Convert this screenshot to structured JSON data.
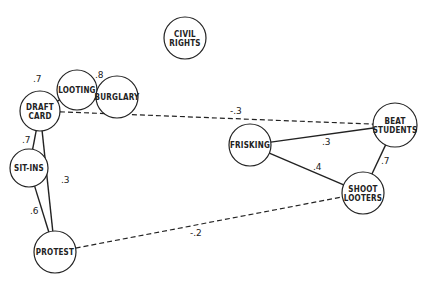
{
  "diagram": {
    "type": "correlation-network",
    "nodes": [
      {
        "id": "civil_rights",
        "lines": [
          "CIVIL",
          "RIGHTS"
        ],
        "x": 185,
        "y": 38,
        "r": 21
      },
      {
        "id": "looting",
        "lines": [
          "LOOTING"
        ],
        "x": 77,
        "y": 90,
        "r": 20
      },
      {
        "id": "burglary",
        "lines": [
          "BURGLARY"
        ],
        "x": 117,
        "y": 97,
        "r": 21
      },
      {
        "id": "draft_card",
        "lines": [
          "DRAFT",
          "CARD"
        ],
        "x": 40,
        "y": 111,
        "r": 20
      },
      {
        "id": "sit_ins",
        "lines": [
          "SIT-INS"
        ],
        "x": 29,
        "y": 168,
        "r": 19
      },
      {
        "id": "protest",
        "lines": [
          "PROTEST"
        ],
        "x": 55,
        "y": 252,
        "r": 21
      },
      {
        "id": "frisking",
        "lines": [
          "FRISKING"
        ],
        "x": 250,
        "y": 145,
        "r": 21
      },
      {
        "id": "beat_students",
        "lines": [
          "BEAT",
          "STUDENTS"
        ],
        "x": 395,
        "y": 125,
        "r": 22
      },
      {
        "id": "shoot_looters",
        "lines": [
          "SHOOT",
          "LOOTERS"
        ],
        "x": 363,
        "y": 193,
        "r": 21
      }
    ],
    "edges": [
      {
        "from": "draft_card",
        "to": "looting",
        "weight": ".7",
        "style": "solid",
        "lx": 33,
        "ly": 82
      },
      {
        "from": "looting",
        "to": "burglary",
        "weight": ".8",
        "style": "solid",
        "lx": 95,
        "ly": 78
      },
      {
        "from": "draft_card",
        "to": "sit_ins",
        "weight": ".7",
        "style": "solid",
        "lx": 22,
        "ly": 143
      },
      {
        "from": "draft_card",
        "to": "protest",
        "weight": ".3",
        "style": "solid",
        "lx": 61,
        "ly": 183
      },
      {
        "from": "sit_ins",
        "to": "protest",
        "weight": ".6",
        "style": "solid",
        "lx": 30,
        "ly": 214
      },
      {
        "from": "draft_card",
        "to": "beat_students",
        "weight": "-.3",
        "style": "dashed",
        "lx": 230,
        "ly": 114
      },
      {
        "from": "frisking",
        "to": "beat_students",
        "weight": ".3",
        "style": "solid",
        "lx": 322,
        "ly": 145
      },
      {
        "from": "frisking",
        "to": "shoot_looters",
        "weight": ".4",
        "style": "solid",
        "lx": 313,
        "ly": 170
      },
      {
        "from": "beat_students",
        "to": "shoot_looters",
        "weight": ".7",
        "style": "solid",
        "lx": 381,
        "ly": 164
      },
      {
        "from": "protest",
        "to": "shoot_looters",
        "weight": "-.2",
        "style": "dashed",
        "lx": 190,
        "ly": 236
      }
    ]
  }
}
